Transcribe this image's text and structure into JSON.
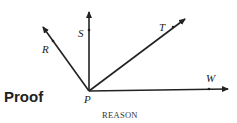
{
  "diagram": {
    "vertex": {
      "label": "P",
      "x": 89,
      "y": 91
    },
    "rays": [
      {
        "label": "R",
        "end": [
          43,
          27
        ],
        "point": [
          53,
          41
        ],
        "label_pos": [
          42,
          53
        ]
      },
      {
        "label": "S",
        "end": [
          89,
          12
        ],
        "point": [
          89,
          30
        ],
        "label_pos": [
          78,
          37
        ]
      },
      {
        "label": "T",
        "end": [
          185,
          19
        ],
        "point": [
          173,
          27
        ],
        "label_pos": [
          159,
          31
        ]
      },
      {
        "label": "W",
        "end": [
          228,
          89
        ],
        "point": [
          209,
          89
        ],
        "label_pos": [
          206,
          82
        ]
      }
    ],
    "color": "#222222"
  },
  "text": {
    "proof_heading": "Proof",
    "reason_heading": "REASON"
  }
}
